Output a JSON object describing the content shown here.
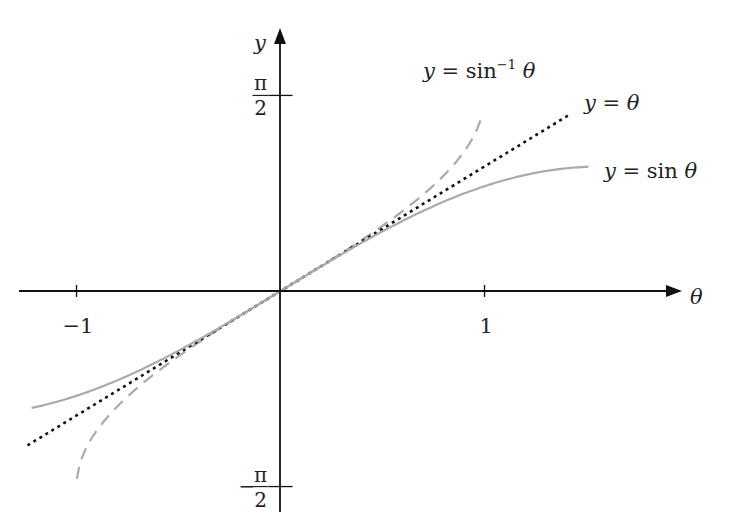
{
  "chart_data": {
    "type": "line",
    "title": "",
    "xlabel": "θ",
    "ylabel": "y",
    "xlim": [
      -1.28,
      1.96
    ],
    "ylim": [
      -1.78,
      2.0
    ],
    "grid": false,
    "legend_position": "inline labels",
    "x_ticks": [
      {
        "value": -1,
        "label": "−1"
      },
      {
        "value": 1,
        "label": "1"
      }
    ],
    "y_ticks": [
      {
        "value": 1.5708,
        "label_num": "π",
        "label_den": "2",
        "sign": ""
      },
      {
        "value": -1.5708,
        "label_num": "π",
        "label_den": "2",
        "sign": "−"
      }
    ],
    "series": [
      {
        "name": "y = sin⁻¹ θ",
        "function": "asin",
        "domain": [
          -0.998,
          0.99
        ],
        "style": "dashed",
        "color": "#aaaaaa",
        "label": {
          "pre": "y = sin",
          "sup": "−1",
          "post": " θ",
          "x": 423,
          "y": 78
        }
      },
      {
        "name": "y = θ",
        "function": "identity",
        "domain": [
          -1.24,
          1.42
        ],
        "style": "dotted",
        "color": "#111111",
        "label": {
          "pre": "y = θ",
          "sup": "",
          "post": "",
          "x": 584,
          "y": 110
        }
      },
      {
        "name": "y = sin θ",
        "function": "sin",
        "domain": [
          -1.22,
          1.51
        ],
        "style": "solid",
        "color": "#aaaaaa",
        "label": {
          "pre": "y = sin θ",
          "sup": "",
          "post": "",
          "x": 604,
          "y": 178
        }
      }
    ]
  },
  "axes": {
    "x_axis_label": "θ",
    "y_axis_label": "y"
  }
}
